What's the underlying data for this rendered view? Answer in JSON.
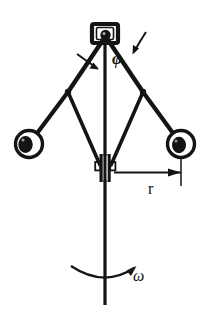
{
  "figure": {
    "name": "centrifugal-flyball-governor-diagram",
    "background_color": "#ffffff",
    "ink_color": "#141414",
    "width": 210,
    "height": 319
  },
  "labels": {
    "angle": "φ",
    "radius": "r",
    "angular_velocity": "ω"
  },
  "parts": {
    "top_housing": "top-bracket-housing",
    "pivot_pin": "top-pivot-pin",
    "shaft": "vertical-rotating-shaft",
    "left_upper_arm": "left-upper-arm",
    "right_upper_arm": "right-upper-arm",
    "left_lower_link": "left-lower-link",
    "right_lower_link": "right-lower-link",
    "left_elbow": "left-elbow-joint",
    "right_elbow": "right-elbow-joint",
    "left_ball": "left-flyball",
    "right_ball": "right-flyball",
    "sleeve": "sliding-sleeve-collar",
    "left_sleeve_pin": "left-sleeve-pin",
    "right_sleeve_pin": "right-sleeve-pin",
    "radius_dimension_line": "radius-dimension-line",
    "radius_extension_line": "radius-extension-line",
    "rotation_arc_arrow": "rotation-arc-arrow",
    "angle_arc_left": "angle-arc-left-arrow",
    "angle_arc_right": "angle-arc-right-arrow"
  },
  "geometry": {
    "shaft_x": 105,
    "shaft_top_y": 34,
    "shaft_bottom_y": 305,
    "pivot": [
      105,
      36
    ],
    "left_elbow": [
      68,
      92
    ],
    "right_elbow": [
      143,
      92
    ],
    "left_ball_center": [
      29,
      144
    ],
    "right_ball_center": [
      181,
      144
    ],
    "ball_radius": 14,
    "sleeve_y": 170,
    "radius_dim_y": 172,
    "radius_dim_x_start": 114,
    "radius_dim_x_end": 182,
    "omega_arc_y": 274
  }
}
